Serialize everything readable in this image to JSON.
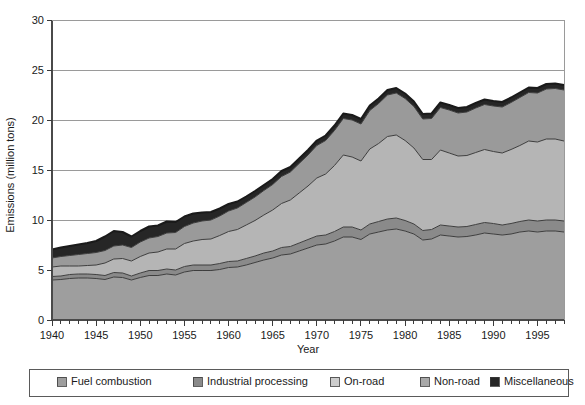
{
  "chart_data": {
    "type": "area",
    "stacked": true,
    "title": "",
    "xlabel": "Year",
    "ylabel": "Emissions (million tons)",
    "xlim": [
      1940,
      1998
    ],
    "ylim": [
      0,
      30
    ],
    "ytick_labels": [
      "0",
      "5",
      "10",
      "15",
      "20",
      "25",
      "30"
    ],
    "ytick_values": [
      0,
      5,
      10,
      15,
      20,
      25,
      30
    ],
    "xtick_labels": [
      "1940",
      "1945",
      "1950",
      "1955",
      "1960",
      "1965",
      "1970",
      "1975",
      "1980",
      "1985",
      "1990",
      "1995"
    ],
    "xtick_values": [
      1940,
      1945,
      1950,
      1955,
      1960,
      1965,
      1970,
      1975,
      1980,
      1985,
      1990,
      1995
    ],
    "minor_xtick_interval": 1,
    "grid": "horizontal",
    "legend_position": "bottom",
    "x": [
      1940,
      1941,
      1942,
      1943,
      1944,
      1945,
      1946,
      1947,
      1948,
      1949,
      1950,
      1951,
      1952,
      1953,
      1954,
      1955,
      1956,
      1957,
      1958,
      1959,
      1960,
      1961,
      1962,
      1963,
      1964,
      1965,
      1966,
      1967,
      1968,
      1969,
      1970,
      1971,
      1972,
      1973,
      1974,
      1975,
      1976,
      1977,
      1978,
      1979,
      1980,
      1981,
      1982,
      1983,
      1984,
      1985,
      1986,
      1987,
      1988,
      1989,
      1990,
      1991,
      1992,
      1993,
      1994,
      1995,
      1996,
      1997,
      1998
    ],
    "series": [
      {
        "name": "Fuel combustion",
        "color": "#9e9e9e",
        "values": [
          4.0,
          4.05,
          4.15,
          4.2,
          4.2,
          4.15,
          4.05,
          4.3,
          4.25,
          4.0,
          4.25,
          4.45,
          4.45,
          4.6,
          4.5,
          4.8,
          4.95,
          4.95,
          4.95,
          5.05,
          5.25,
          5.3,
          5.5,
          5.75,
          6.0,
          6.2,
          6.5,
          6.6,
          6.9,
          7.2,
          7.5,
          7.6,
          7.9,
          8.3,
          8.3,
          8.05,
          8.6,
          8.8,
          9.0,
          9.1,
          8.9,
          8.6,
          8.0,
          8.1,
          8.5,
          8.4,
          8.3,
          8.35,
          8.5,
          8.7,
          8.6,
          8.5,
          8.6,
          8.8,
          8.9,
          8.8,
          8.9,
          8.9,
          8.8
        ]
      },
      {
        "name": "Industrial processing",
        "color": "#8a8a8a",
        "values": [
          0.35,
          0.35,
          0.4,
          0.4,
          0.4,
          0.4,
          0.4,
          0.45,
          0.45,
          0.4,
          0.45,
          0.5,
          0.5,
          0.5,
          0.5,
          0.55,
          0.55,
          0.55,
          0.55,
          0.6,
          0.6,
          0.6,
          0.65,
          0.65,
          0.7,
          0.7,
          0.75,
          0.75,
          0.8,
          0.85,
          0.9,
          0.9,
          0.95,
          1.0,
          1.0,
          0.95,
          1.0,
          1.05,
          1.1,
          1.1,
          1.05,
          1.0,
          0.95,
          0.95,
          1.0,
          1.0,
          1.0,
          1.0,
          1.05,
          1.05,
          1.05,
          1.0,
          1.05,
          1.05,
          1.1,
          1.1,
          1.1,
          1.1,
          1.1
        ]
      },
      {
        "name": "On-road",
        "color": "#b5b5b5",
        "values": [
          0.95,
          1.0,
          0.85,
          0.8,
          0.85,
          0.95,
          1.25,
          1.35,
          1.45,
          1.5,
          1.65,
          1.75,
          1.85,
          2.0,
          2.1,
          2.3,
          2.4,
          2.55,
          2.6,
          2.8,
          3.0,
          3.15,
          3.35,
          3.55,
          3.8,
          4.1,
          4.4,
          4.65,
          5.0,
          5.35,
          5.8,
          6.1,
          6.6,
          7.2,
          7.0,
          6.9,
          7.5,
          7.8,
          8.25,
          8.3,
          8.0,
          7.6,
          7.1,
          7.0,
          7.5,
          7.3,
          7.1,
          7.1,
          7.2,
          7.3,
          7.2,
          7.2,
          7.4,
          7.6,
          7.9,
          7.9,
          8.1,
          8.1,
          8.0
        ]
      },
      {
        "name": "Non-road",
        "color": "#9a9a9a",
        "values": [
          0.9,
          0.95,
          1.05,
          1.15,
          1.2,
          1.25,
          1.25,
          1.3,
          1.35,
          1.35,
          1.45,
          1.5,
          1.55,
          1.6,
          1.65,
          1.7,
          1.8,
          1.85,
          1.9,
          1.95,
          2.05,
          2.15,
          2.25,
          2.35,
          2.45,
          2.55,
          2.7,
          2.8,
          2.95,
          3.1,
          3.25,
          3.35,
          3.5,
          3.65,
          3.7,
          3.7,
          3.85,
          4.0,
          4.15,
          4.2,
          4.2,
          4.15,
          4.05,
          4.1,
          4.25,
          4.3,
          4.3,
          4.35,
          4.45,
          4.5,
          4.55,
          4.6,
          4.7,
          4.8,
          4.85,
          4.9,
          5.0,
          5.05,
          5.1
        ]
      },
      {
        "name": "Miscellaneous",
        "color": "#262626",
        "values": [
          0.85,
          0.9,
          0.95,
          1.0,
          1.05,
          1.15,
          1.4,
          1.5,
          1.3,
          1.1,
          1.1,
          1.15,
          1.1,
          1.15,
          1.05,
          1.0,
          0.95,
          0.85,
          0.8,
          0.75,
          0.7,
          0.65,
          0.6,
          0.6,
          0.55,
          0.55,
          0.55,
          0.5,
          0.5,
          0.5,
          0.5,
          0.5,
          0.5,
          0.5,
          0.5,
          0.5,
          0.5,
          0.5,
          0.5,
          0.5,
          0.5,
          0.5,
          0.5,
          0.5,
          0.5,
          0.5,
          0.5,
          0.5,
          0.5,
          0.5,
          0.5,
          0.5,
          0.5,
          0.5,
          0.5,
          0.5,
          0.5,
          0.5,
          0.5
        ]
      }
    ]
  },
  "legend": {
    "items": [
      {
        "label": "Fuel combustion",
        "color": "#9e9e9e"
      },
      {
        "label": "Industrial processing",
        "color": "#8a8a8a"
      },
      {
        "label": "On-road",
        "color": "#cccccc"
      },
      {
        "label": "Non-road",
        "color": "#a8a8a8"
      },
      {
        "label": "Miscellaneous",
        "color": "#262626"
      }
    ]
  }
}
